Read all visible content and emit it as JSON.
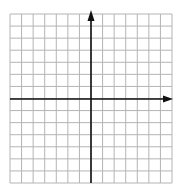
{
  "diagram": {
    "type": "coordinate-plane",
    "title": "",
    "grid": {
      "columns": 14,
      "rows": 14,
      "left": 10,
      "top": 14,
      "right": 172,
      "bottom": 183,
      "line_color": "#b4b4b4"
    },
    "axes": {
      "x_axis_y": 99,
      "y_axis_x": 91,
      "color": "#111111",
      "x_arrow": "right",
      "y_arrow": "up",
      "tick_labels": []
    },
    "background": "#ffffff"
  }
}
